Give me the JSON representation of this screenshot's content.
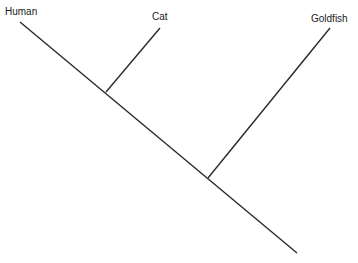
{
  "diagram": {
    "type": "cladogram",
    "taxa": [
      {
        "label": "Human"
      },
      {
        "label": "Cat"
      },
      {
        "label": "Goldfish"
      }
    ],
    "line_color": "#2a2a2a",
    "background": "#ffffff"
  }
}
